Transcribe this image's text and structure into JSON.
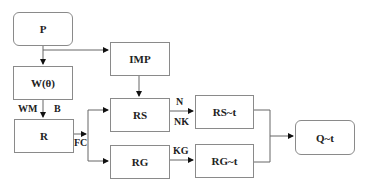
{
  "nodes": {
    "p": "P",
    "w": "W(θ)",
    "imp": "IMP",
    "r": "R",
    "rs": "RS",
    "rg": "RG",
    "rs_t": "RS~t",
    "rg_t": "RG~t",
    "q_t": "Q~t"
  },
  "edge_labels": {
    "wm": "WM",
    "b": "B",
    "fc": "FC",
    "n": "N",
    "nk": "NK",
    "kg": "KG"
  },
  "colors": {
    "line": "#555555",
    "border": "#8a8a8a"
  }
}
